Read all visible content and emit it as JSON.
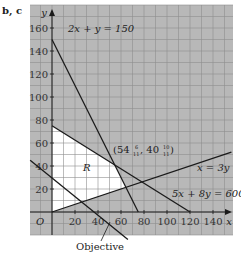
{
  "part_label": "b, c",
  "chart_data": {
    "type": "line",
    "title": "",
    "xlabel": "x",
    "ylabel": "y",
    "xlim": [
      -20,
      155
    ],
    "ylim": [
      -20,
      180
    ],
    "grid": true,
    "x_ticks": [
      20,
      40,
      60,
      80,
      100,
      120,
      140
    ],
    "y_ticks": [
      20,
      40,
      60,
      80,
      100,
      120,
      140,
      160
    ],
    "origin_label": "O",
    "series": [
      {
        "name": "2x + y = 150",
        "points": [
          [
            0,
            150
          ],
          [
            75,
            0
          ]
        ]
      },
      {
        "name": "5x + 8y = 600",
        "points": [
          [
            0,
            75
          ],
          [
            120,
            0
          ]
        ]
      },
      {
        "name": "x = 3y",
        "points": [
          [
            0,
            0
          ],
          [
            156,
            52
          ]
        ]
      },
      {
        "name": "Objective",
        "points": [
          [
            -19,
            45
          ],
          [
            66,
            -24
          ]
        ]
      }
    ],
    "feasible_region": {
      "label": "R",
      "vertices": [
        [
          0,
          0
        ],
        [
          0,
          75
        ],
        [
          54.55,
          40.91
        ],
        [
          64.29,
          21.43
        ]
      ]
    },
    "annotations": [
      {
        "text": "(54 6/11, 40 10/11)",
        "whole_x": "54",
        "num_x": "6",
        "den_x": "11",
        "whole_y": "40",
        "num_y": "10",
        "den_y": "11",
        "point": [
          54.55,
          40.91
        ]
      },
      {
        "text": "2x + y = 150"
      },
      {
        "text": "x = 3y"
      },
      {
        "text": "5x + 8y = 600"
      },
      {
        "text": "Objective"
      }
    ]
  },
  "colors": {
    "grid_bg": "#b8b8b8",
    "grid_line": "#8f8f8f",
    "region_fill": "#ffffff",
    "line": "#1a1a1a"
  }
}
